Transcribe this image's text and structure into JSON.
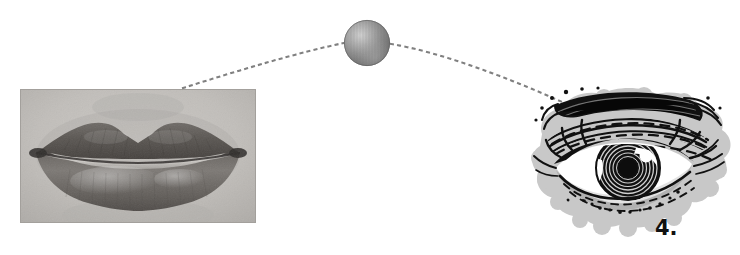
{
  "figure": {
    "number_label": "4.",
    "background_color": "#ffffff",
    "width": 740,
    "height": 255
  },
  "lips_image": {
    "subject": "close-up photograph of a pair of human lips, closed, grayscale halftone print",
    "alt_text": "Lips",
    "rect": {
      "x": 20,
      "y": 89,
      "width": 236,
      "height": 134
    },
    "palette": {
      "skin_light": "#c9c6c2",
      "skin_mid": "#b4b1ad",
      "lip_mid": "#8c8884",
      "lip_dark": "#5c5854",
      "lip_darkest": "#3e3a37",
      "highlight": "#d8d5d1",
      "border": "#a8a5a1"
    }
  },
  "sphere": {
    "label": "shaded sphere",
    "center": {
      "x": 367,
      "y": 43
    },
    "radius": 23,
    "palette": {
      "highlight": "#cfcfcf",
      "mid": "#9a9a9a",
      "shadow": "#6b6b6b",
      "edge": "#5a5a5a"
    }
  },
  "dotted_arc": {
    "label": "dotted trajectory arc connecting lips to eye via sphere",
    "dot_color": "#808080",
    "dot_size": 2,
    "dot_spacing": 7,
    "start": {
      "x": 183,
      "y": 88
    },
    "apex": {
      "x": 367,
      "y": 43
    },
    "end": {
      "x": 571,
      "y": 106
    }
  },
  "eye_illustration": {
    "subject": "woodcut / engraving style drawing of a human eye with eyebrow, lashes and spiral iris",
    "alt_text": "Eye",
    "rect": {
      "x": 524,
      "y": 84,
      "width": 212,
      "height": 158
    },
    "palette": {
      "wash_gray": "#c8c8c8",
      "ink_black": "#111111",
      "sclera_white": "#ffffff",
      "iris_dark": "#0d0d0d"
    }
  }
}
